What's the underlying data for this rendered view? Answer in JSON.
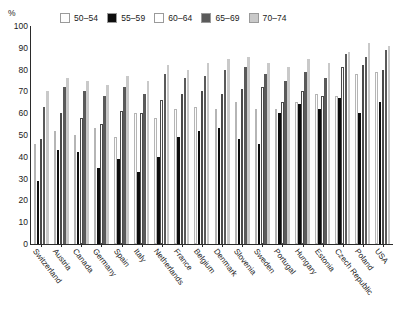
{
  "axis": {
    "y_unit": "%",
    "y_ticks": [
      0,
      10,
      20,
      30,
      40,
      50,
      60,
      70,
      80,
      90,
      100
    ]
  },
  "legend": {
    "items": [
      {
        "label": "50–54",
        "color": "#fdfdfd"
      },
      {
        "label": "55–59",
        "color": "#0d0d0d"
      },
      {
        "label": "60–64",
        "color": "#ffffff"
      },
      {
        "label": "65–69",
        "color": "#5a5a5a"
      },
      {
        "label": "70–74",
        "color": "#c9c9c9"
      }
    ]
  },
  "chart_data": {
    "type": "bar",
    "title": "",
    "xlabel": "",
    "ylabel": "%",
    "ylim": [
      0,
      100
    ],
    "grid": false,
    "legend_position": "top",
    "categories": [
      "Switzerland",
      "Austria",
      "Canada",
      "Germany",
      "Spain",
      "Italy",
      "Netherlands",
      "France",
      "Belgium",
      "Denmark",
      "Slovenia",
      "Sweden",
      "Portugal",
      "Hungary",
      "Estonia",
      "Czech Republic",
      "Poland",
      "USA"
    ],
    "series": [
      {
        "name": "50–54",
        "color": "#fdfdfd",
        "values": [
          46,
          52,
          50,
          53,
          49,
          60,
          58,
          62,
          63,
          62,
          65,
          62,
          62,
          65,
          69,
          68,
          78,
          79
        ]
      },
      {
        "name": "55–59",
        "color": "#0d0d0d",
        "values": [
          29,
          43,
          42,
          35,
          39,
          33,
          40,
          49,
          52,
          53,
          48,
          46,
          60,
          64,
          62,
          67,
          60,
          65
        ]
      },
      {
        "name": "60–64",
        "color": "#ffffff",
        "values": [
          48,
          60,
          58,
          55,
          61,
          60,
          66,
          69,
          70,
          69,
          71,
          72,
          65,
          70,
          68,
          81,
          82,
          80
        ]
      },
      {
        "name": "65–69",
        "color": "#5a5a5a",
        "values": [
          63,
          72,
          70,
          68,
          72,
          69,
          78,
          76,
          77,
          80,
          81,
          78,
          75,
          79,
          76,
          87,
          86,
          89
        ]
      },
      {
        "name": "70–74",
        "color": "#c9c9c9",
        "values": [
          70,
          76,
          75,
          73,
          77,
          75,
          82,
          80,
          83,
          85,
          86,
          83,
          81,
          85,
          83,
          88,
          92,
          91
        ]
      }
    ]
  }
}
